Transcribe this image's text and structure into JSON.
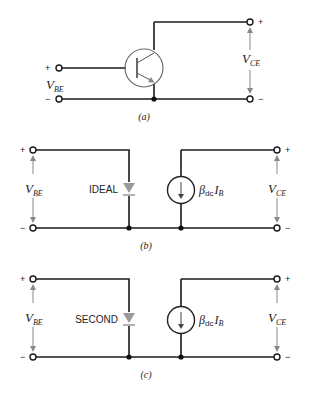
{
  "figure": {
    "panels": [
      {
        "id": "a",
        "caption": "(a)",
        "caption_letter": "a",
        "component": "npn-transistor",
        "left_voltage": {
          "symbol": "V",
          "subscript": "BE",
          "plus": "+",
          "minus": "−"
        },
        "right_voltage": {
          "symbol": "V",
          "subscript": "CE",
          "plus": "+",
          "minus": "−"
        }
      },
      {
        "id": "b",
        "caption": "(b)",
        "caption_letter": "b",
        "diode_label": "IDEAL",
        "current_source": {
          "beta": "β",
          "beta_sub": "dc",
          "current": "I",
          "current_sub": "B"
        },
        "left_voltage": {
          "symbol": "V",
          "subscript": "BE",
          "plus": "+",
          "minus": "−"
        },
        "right_voltage": {
          "symbol": "V",
          "subscript": "CE",
          "plus": "+",
          "minus": "−"
        }
      },
      {
        "id": "c",
        "caption": "(c)",
        "caption_letter": "c",
        "diode_label": "SECOND",
        "current_source": {
          "beta": "β",
          "beta_sub": "dc",
          "current": "I",
          "current_sub": "B"
        },
        "left_voltage": {
          "symbol": "V",
          "subscript": "BE",
          "plus": "+",
          "minus": "−"
        },
        "right_voltage": {
          "symbol": "V",
          "subscript": "CE",
          "plus": "+",
          "minus": "−"
        }
      }
    ],
    "colors": {
      "wire": "#1a1a1a",
      "diode": "#999999",
      "arrow": "#888888"
    }
  }
}
